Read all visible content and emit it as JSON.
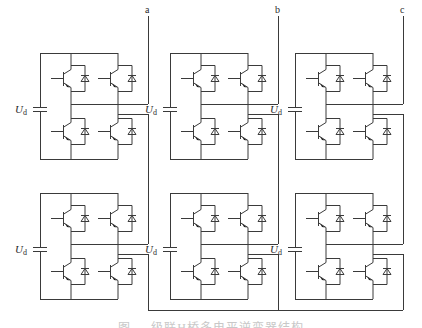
{
  "diagram": {
    "line_color": "#3a3a3a",
    "background": "#ffffff",
    "phases": [
      {
        "label": "a",
        "x": 148,
        "label_y": 10
      },
      {
        "label": "b",
        "x": 278,
        "label_y": 10
      },
      {
        "label": "c",
        "x": 403,
        "label_y": 10
      }
    ],
    "cells": [
      {
        "id": "a1",
        "phase": "a",
        "x0": 40,
        "y0": 53,
        "cap_label": "U",
        "cap_sub": "d"
      },
      {
        "id": "b1",
        "phase": "b",
        "x0": 170,
        "y0": 53,
        "cap_label": "U",
        "cap_sub": "d"
      },
      {
        "id": "c1",
        "phase": "c",
        "x0": 295,
        "y0": 53,
        "cap_label": "U",
        "cap_sub": "d"
      },
      {
        "id": "a2",
        "phase": "a",
        "x0": 40,
        "y0": 193,
        "cap_label": "U",
        "cap_sub": "d"
      },
      {
        "id": "b2",
        "phase": "b",
        "x0": 170,
        "y0": 193,
        "cap_label": "U",
        "cap_sub": "d"
      },
      {
        "id": "c2",
        "phase": "c",
        "x0": 295,
        "y0": 193,
        "cap_label": "U",
        "cap_sub": "d"
      }
    ],
    "cell_components": [
      "capacitor",
      "igbt_upper_left",
      "igbt_upper_right",
      "igbt_lower_left",
      "igbt_lower_right",
      "diode_x4"
    ],
    "neutral_bus_y": 310,
    "caption": "图 ... 级联H桥多电平逆变器结构"
  }
}
